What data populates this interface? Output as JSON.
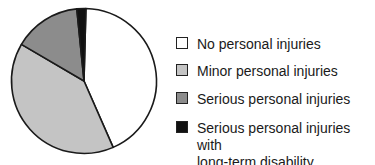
{
  "chart_data": {
    "type": "pie",
    "title": "",
    "start_angle_deg": 1.5,
    "direction": "clockwise",
    "legend_position": "right",
    "categories": [
      "No personal injuries",
      "Minor personal injuries",
      "Serious personal injuries",
      "Serious personal injuries with long-term disability"
    ],
    "values": [
      43,
      40,
      15,
      2
    ],
    "colors": [
      "#ffffff",
      "#c4c4c4",
      "#8c8c8c",
      "#111111"
    ]
  },
  "legend": {
    "items": [
      {
        "label": "No personal injuries",
        "color": "#ffffff"
      },
      {
        "label": "Minor personal injuries",
        "color": "#c4c4c4"
      },
      {
        "label": "Serious personal injuries",
        "color": "#8c8c8c"
      },
      {
        "label": "Serious personal injuries with\nlong-term disability",
        "color": "#111111"
      }
    ]
  }
}
